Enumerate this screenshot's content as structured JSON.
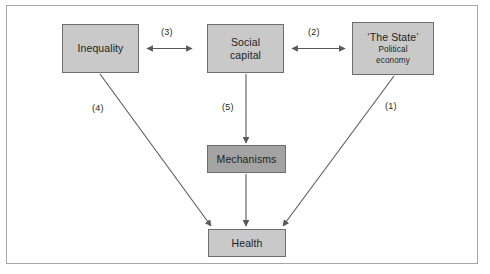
{
  "figure": {
    "colors": {
      "node_fill_light": "#c9c9c9",
      "node_fill_dark": "#a3a3a3",
      "node_border": "#6e6e6e",
      "frame_border": "#a6a6a6",
      "arrow": "#5a5a5a",
      "text": "#231f20",
      "background": "#ffffff"
    }
  },
  "nodes": [
    {
      "id": "inequality",
      "line1": "Inequality",
      "line2": "",
      "line3": "",
      "fill": "light"
    },
    {
      "id": "social-capital",
      "line1": "Social",
      "line2": "capital",
      "line3": "",
      "fill": "light"
    },
    {
      "id": "the-state",
      "line1": "‘The State’",
      "line2": "Political",
      "line3": "economy",
      "fill": "light"
    },
    {
      "id": "mechanisms",
      "line1": "Mechanisms",
      "line2": "",
      "line3": "",
      "fill": "dark"
    },
    {
      "id": "health",
      "line1": "Health",
      "line2": "",
      "line3": "",
      "fill": "light"
    }
  ],
  "edges": [
    {
      "id": "edge-1",
      "label": "(1)",
      "from": "the-state",
      "to": "health",
      "arrow": "single"
    },
    {
      "id": "edge-2",
      "label": "(2)",
      "from": "social-capital",
      "to": "the-state",
      "arrow": "double"
    },
    {
      "id": "edge-3",
      "label": "(3)",
      "from": "inequality",
      "to": "social-capital",
      "arrow": "double"
    },
    {
      "id": "edge-4",
      "label": "(4)",
      "from": "inequality",
      "to": "health",
      "arrow": "single"
    },
    {
      "id": "edge-5",
      "label": "(5)",
      "from": "social-capital",
      "to": "mechanisms",
      "arrow": "single"
    }
  ]
}
